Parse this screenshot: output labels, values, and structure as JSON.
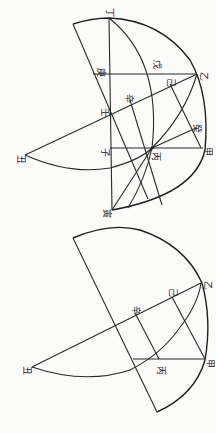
{
  "figures": [
    {
      "id": "top-figure",
      "labels": [
        {
          "text": "丁",
          "x": 109,
          "y": 12
        },
        {
          "text": "乙",
          "x": 203,
          "y": 76
        },
        {
          "text": "戊",
          "x": 156,
          "y": 64
        },
        {
          "text": "己",
          "x": 170,
          "y": 82
        },
        {
          "text": "庚",
          "x": 100,
          "y": 72
        },
        {
          "text": "辛",
          "x": 128,
          "y": 98
        },
        {
          "text": "壬",
          "x": 104,
          "y": 112
        },
        {
          "text": "癸",
          "x": 196,
          "y": 128
        },
        {
          "text": "甲",
          "x": 207,
          "y": 151
        },
        {
          "text": "丙",
          "x": 155,
          "y": 156
        },
        {
          "text": "子",
          "x": 104,
          "y": 152
        },
        {
          "text": "丑",
          "x": 20,
          "y": 159
        },
        {
          "text": "寅",
          "x": 106,
          "y": 213
        }
      ]
    },
    {
      "id": "bottom-figure",
      "labels": [
        {
          "text": "乙",
          "x": 207,
          "y": 285
        },
        {
          "text": "己",
          "x": 172,
          "y": 292
        },
        {
          "text": "辛",
          "x": 135,
          "y": 310
        },
        {
          "text": "甲",
          "x": 209,
          "y": 363
        },
        {
          "text": "丙",
          "x": 160,
          "y": 370
        },
        {
          "text": "丑",
          "x": 26,
          "y": 370
        }
      ]
    }
  ]
}
